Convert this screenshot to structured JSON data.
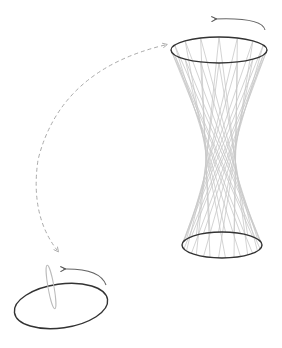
{
  "diagram": {
    "title": "",
    "colors": {
      "background": "#ffffff",
      "ellipse_stroke": "#333333",
      "ruling_stroke": "#c8c8c8",
      "arrow_stroke": "#555555",
      "dashed_stroke": "#aaaaaa",
      "segment_stroke": "#bbbbbb"
    },
    "hyperboloid": {
      "top_ellipse": {
        "cx": 219,
        "cy": 50,
        "rx": 48,
        "ry": 13
      },
      "bottom_ellipse": {
        "cx": 222,
        "cy": 245,
        "rx": 40,
        "ry": 13
      },
      "ruling_count": 16,
      "twist_degrees": 140
    },
    "small_figure": {
      "ellipse": {
        "cx": 61,
        "cy": 306,
        "rx": 47,
        "ry": 22,
        "rotate": -8
      },
      "segment_ellipse": {
        "cx": 51,
        "cy": 287,
        "rx": 3,
        "ry": 22,
        "rotate": -10
      }
    },
    "rotation_arrows": [
      {
        "name": "top-rotation-arrow",
        "path": "M 265 30 Q 262 17 214 19"
      },
      {
        "name": "bottom-rotation-arrow",
        "path": "M 106 285 Q 100 268 63 269"
      }
    ],
    "dashed_connector": {
      "path": "M 165 45 Q 60 70 38 160 Q 30 215 57 250"
    }
  }
}
